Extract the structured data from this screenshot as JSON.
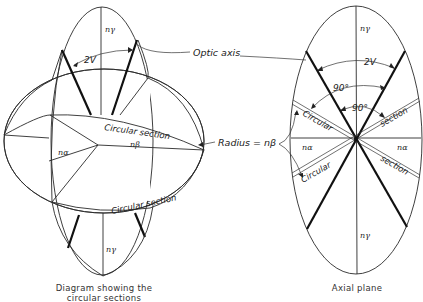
{
  "left_diagram": {
    "caption_line1": "Diagram showing the",
    "caption_line2": "circular sections",
    "labels": {
      "n_gamma_top": "nγ",
      "n_gamma_bottom": "nγ",
      "two_v": "2V",
      "circular_section_upper": "Circular section",
      "circular_section_lower": "Circular section",
      "n_beta": "nβ",
      "n_alpha": "nα"
    }
  },
  "right_diagram": {
    "caption": "Axial plane",
    "labels": {
      "n_gamma_top": "nγ",
      "n_gamma_bottom": "nγ",
      "two_v": "2V",
      "angle_90_outer": "90°",
      "angle_90_inner": "90°",
      "circular_upper_left": "Circular",
      "section_upper_right": "section",
      "circular_lower_left": "Circular",
      "section_lower_right": "section",
      "n_alpha_left": "nα",
      "n_alpha_right": "nα"
    }
  },
  "callouts": {
    "optic_axis": "Optic axis",
    "radius": "Radius = nβ"
  }
}
